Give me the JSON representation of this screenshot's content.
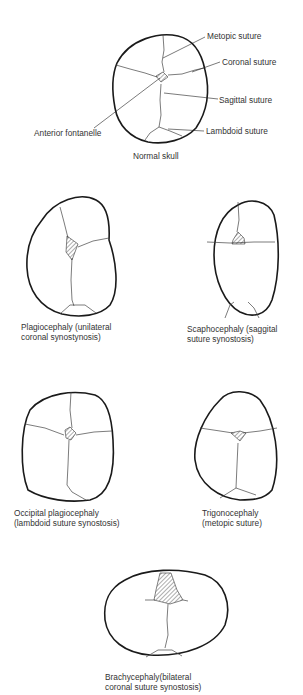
{
  "normal_skull": {
    "caption": "Normal skull",
    "labels": {
      "metopic": "Metopic suture",
      "coronal": "Coronal suture",
      "sagittal": "Sagittal suture",
      "lambdoid": "Lambdoid suture",
      "fontanelle": "Anterior fontanelle"
    }
  },
  "variants": [
    {
      "name": "Plagiocephaly",
      "caption_line1": "Plagiocephaly (unilateral",
      "caption_line2": "coronal synostynosis)"
    },
    {
      "name": "Scaphocephaly",
      "caption_line1": "Scaphocephaly (saggital",
      "caption_line2": "suture synostosis)"
    },
    {
      "name": "Occipital plagiocephaly",
      "caption_line1": "Occipital plagiocephaly",
      "caption_line2": "(lambdoid suture synostosis)"
    },
    {
      "name": "Trigonocephaly",
      "caption_line1": "Trigonocephaly",
      "caption_line2": "(metopic suture)"
    },
    {
      "name": "Brachycephaly",
      "caption_line1": "Brachycephaly(bilateral",
      "caption_line2": "coronal suture synostosis)"
    }
  ],
  "colors": {
    "outline": "#1a1a1a",
    "suture": "#444444",
    "background": "#ffffff"
  }
}
